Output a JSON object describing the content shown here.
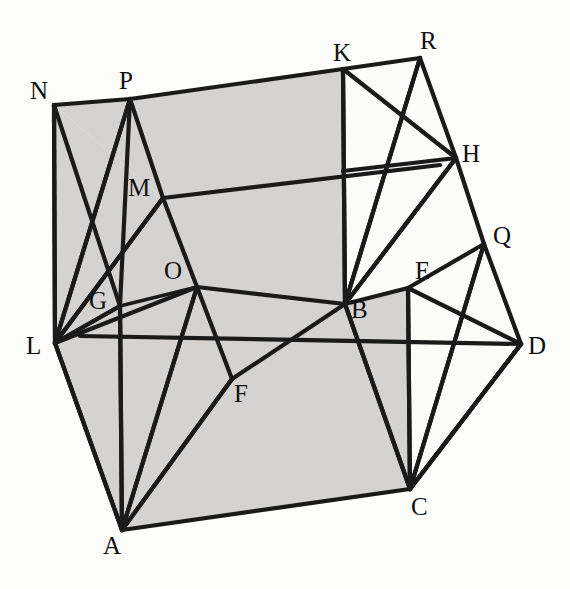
{
  "figure": {
    "background_color": "#fdfdfb",
    "shaded_face_color": "#d4d3d1",
    "unshaded_face_color": "#fbfbf9",
    "line_color": "#1a1a1a",
    "labels": [
      {
        "id": "N",
        "text": "N",
        "x": 30,
        "y": 78
      },
      {
        "id": "P",
        "text": "P",
        "x": 119,
        "y": 68
      },
      {
        "id": "K",
        "text": "K",
        "x": 333,
        "y": 40
      },
      {
        "id": "R",
        "text": "R",
        "x": 420,
        "y": 28
      },
      {
        "id": "H",
        "text": "H",
        "x": 462,
        "y": 141
      },
      {
        "id": "M",
        "text": "M",
        "x": 128,
        "y": 175
      },
      {
        "id": "Q",
        "text": "Q",
        "x": 493,
        "y": 223
      },
      {
        "id": "O",
        "text": "O",
        "x": 164,
        "y": 258
      },
      {
        "id": "E",
        "text": "E",
        "x": 415,
        "y": 258
      },
      {
        "id": "G",
        "text": "G",
        "x": 89,
        "y": 288
      },
      {
        "id": "B",
        "text": "B",
        "x": 351,
        "y": 297
      },
      {
        "id": "L",
        "text": "L",
        "x": 26,
        "y": 333
      },
      {
        "id": "D",
        "text": "D",
        "x": 528,
        "y": 333
      },
      {
        "id": "F",
        "text": "F",
        "x": 234,
        "y": 381
      },
      {
        "id": "C",
        "text": "C",
        "x": 411,
        "y": 494
      },
      {
        "id": "A",
        "text": "A",
        "x": 103,
        "y": 533
      }
    ],
    "vertices": {
      "N": [
        54,
        105
      ],
      "P": [
        130,
        99
      ],
      "K": [
        343,
        69
      ],
      "R": [
        420,
        58
      ],
      "H": [
        456,
        158
      ],
      "M": [
        163,
        198
      ],
      "Q": [
        484,
        244
      ],
      "O": [
        197,
        287
      ],
      "E": [
        408,
        288
      ],
      "G": [
        120,
        306
      ],
      "B": [
        345,
        304
      ],
      "L": [
        55,
        343
      ],
      "D": [
        521,
        344
      ],
      "F": [
        232,
        379
      ],
      "C": [
        410,
        489
      ],
      "A": [
        122,
        530
      ]
    },
    "faces": [
      {
        "name": "top-face",
        "shaded": true,
        "path": "N P K B O"
      },
      {
        "name": "left-face",
        "shaded": true,
        "path": "N L G M"
      },
      {
        "name": "front-face",
        "shaded": true,
        "path": "L A C E B"
      },
      {
        "name": "right-face",
        "shaded": false,
        "path": "K R H Q D C"
      }
    ],
    "edge_count": 38,
    "vertex_count": 16
  }
}
